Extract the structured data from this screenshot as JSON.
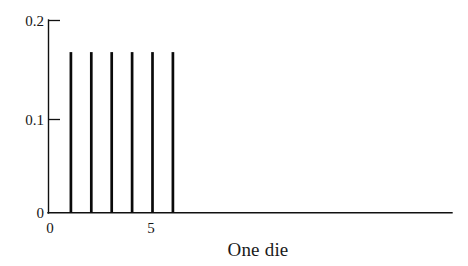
{
  "chart_data": {
    "type": "bar",
    "title": "",
    "subtitle": "",
    "xlabel": "One die",
    "ylabel": "",
    "categories": [
      "1",
      "2",
      "3",
      "4",
      "5",
      "6"
    ],
    "x": [
      1,
      2,
      3,
      4,
      5,
      6
    ],
    "values": [
      0.1667,
      0.1667,
      0.1667,
      0.1667,
      0.1667,
      0.1667
    ],
    "series": [
      {
        "name": "Probability",
        "values": [
          0.1667,
          0.1667,
          0.1667,
          0.1667,
          0.1667,
          0.1667
        ]
      }
    ],
    "xlim": [
      0,
      20
    ],
    "ylim": [
      0,
      0.2
    ],
    "grid": false,
    "legend": false,
    "legend_position": "none",
    "style": "spike",
    "x_ticks": [
      {
        "value": 0,
        "label": "0"
      },
      {
        "value": 5,
        "label": "5"
      }
    ],
    "y_ticks": [
      {
        "value": 0,
        "label": "0"
      },
      {
        "value": 0.1,
        "label": "0.1"
      },
      {
        "value": 0.2,
        "label": "0.2"
      }
    ],
    "annotations": []
  },
  "axes": {
    "x_title": "One die",
    "y_tick_top": "0.2",
    "y_tick_mid": "0.1",
    "y_tick_zero": "0",
    "x_tick_zero": "0",
    "x_tick_five": "5"
  },
  "colors": {
    "background": "#ffffff",
    "ink": "#101010",
    "spike": "#0a0a0a"
  }
}
